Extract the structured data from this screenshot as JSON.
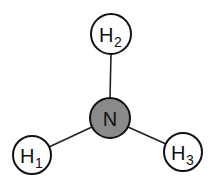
{
  "diagram": {
    "type": "molecule-structure",
    "colors": {
      "bond": "#222222",
      "outline": "#111111",
      "hydrogen_fill": "#ffffff",
      "nitrogen_fill": "#8a8a8a"
    },
    "atoms": [
      {
        "id": "N",
        "element": "N",
        "subscript": "",
        "cx": 110,
        "cy": 118,
        "r": 20
      },
      {
        "id": "H2",
        "element": "H",
        "subscript": "2",
        "cx": 111,
        "cy": 34,
        "r": 20
      },
      {
        "id": "H1",
        "element": "H",
        "subscript": "1",
        "cx": 32,
        "cy": 155,
        "r": 19
      },
      {
        "id": "H3",
        "element": "H",
        "subscript": "3",
        "cx": 183,
        "cy": 152,
        "r": 19
      }
    ],
    "bonds": [
      {
        "from": "N",
        "to": "H2"
      },
      {
        "from": "N",
        "to": "H1"
      },
      {
        "from": "N",
        "to": "H3"
      }
    ]
  }
}
